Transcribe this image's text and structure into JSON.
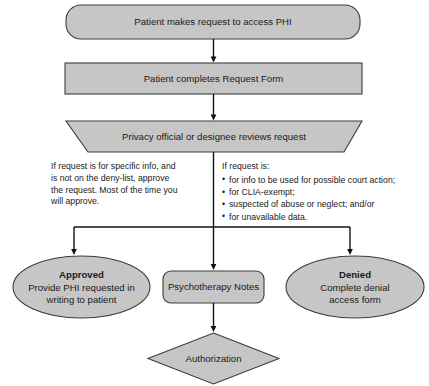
{
  "diagram": {
    "style": {
      "shape_fill": "#c6c6c6",
      "shape_stroke": "#3c3c3c",
      "line_color": "#111111",
      "background": "#ffffff",
      "text_color": "#1a1a1a"
    },
    "nodes": {
      "request": {
        "shape": "rounded-rectangle",
        "label": "Patient makes request to access PHI"
      },
      "form": {
        "shape": "rectangle",
        "label": "Patient completes Request Form"
      },
      "review": {
        "shape": "trapezoid",
        "label": "Privacy official or designee reviews request"
      },
      "approved": {
        "shape": "ellipse",
        "title": "Approved",
        "line1": "Provide PHI requested in",
        "line2": "writing to patient"
      },
      "psychotherapy": {
        "shape": "rounded-rectangle",
        "label": "Psychotherapy Notes"
      },
      "denied": {
        "shape": "ellipse",
        "title": "Denied",
        "line1": "Complete denial",
        "line2": "access form"
      },
      "authorization": {
        "shape": "diamond",
        "label": "Authorization"
      }
    },
    "annotations": {
      "left_note": {
        "line1": "If request is for specific info, and",
        "line2": "is not on the deny-list, approve",
        "line3": "the request. Most of the time you",
        "line4": "will approve."
      },
      "right_note": {
        "heading": "If request is:",
        "bullets": [
          "for info to be used for possible court action;",
          "for CLIA-exempt;",
          "suspected of abuse or neglect; and/or",
          "for unavailable data."
        ]
      }
    }
  }
}
